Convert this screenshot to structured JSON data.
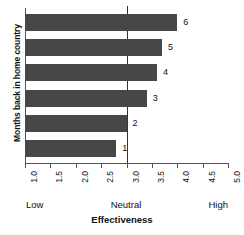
{
  "chart_data": {
    "type": "bar",
    "orientation": "horizontal",
    "title": "",
    "xlabel": "Effectiveness",
    "ylabel": "Months back in home country",
    "categories": [
      "1",
      "2",
      "3",
      "4",
      "5",
      "6"
    ],
    "values": [
      2.8,
      3.0,
      3.4,
      3.6,
      3.7,
      4.0
    ],
    "bar_labels": [
      "1",
      "2",
      "3",
      "4",
      "5",
      "6"
    ],
    "xlim": [
      1.0,
      5.0
    ],
    "xticks": [
      "1.0",
      "1.5",
      "2.0",
      "2.5",
      "3.0",
      "3.5",
      "4.0",
      "4.5",
      "5.0"
    ],
    "xtick_values": [
      1.0,
      1.5,
      2.0,
      2.5,
      3.0,
      3.5,
      4.0,
      4.5,
      5.0
    ],
    "grid": false,
    "legend": null,
    "reference_line": {
      "value": 3.0,
      "label": "Neutral"
    },
    "scale_anchors": {
      "low": "Low",
      "neutral": "Neutral",
      "high": "High"
    },
    "colors": {
      "bar": "#474747",
      "axis": "#555555",
      "text": "#111111",
      "background": "#ffffff"
    }
  }
}
